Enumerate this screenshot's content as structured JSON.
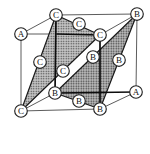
{
  "figure": {
    "kind": "fcc-unit-cell-111-stacking-diagram",
    "background": "#ffffff"
  },
  "diagram": {
    "colors": {
      "thin_edge": "#4a4a4a",
      "bold_edge": "#0d0d0d",
      "plane_stroke": "#1a1a1a",
      "plane_base_c": "#c6c6c6",
      "plane_base_b": "#bfbfbf",
      "plane_dot": "#3f3f3f",
      "atom_fill": "#ffffff",
      "atom_stroke": "#222222",
      "label_color": "#111111"
    },
    "atom_style": {
      "radius": 6.3,
      "stroke_width": 1.15,
      "font_size": 9
    },
    "atoms": [
      {
        "label": "A",
        "x": 21,
        "y": 34,
        "site": "front-top-left-corner"
      },
      {
        "label": "C",
        "x": 56,
        "y": 15,
        "site": "back-top-left-corner"
      },
      {
        "label": "C",
        "x": 79,
        "y": 24,
        "site": "top-face-center"
      },
      {
        "label": "B",
        "x": 137,
        "y": 14,
        "site": "back-top-right-corner"
      },
      {
        "label": "C",
        "x": 100,
        "y": 35,
        "site": "front-top-right-corner"
      },
      {
        "label": "C",
        "x": 40,
        "y": 62,
        "site": "left-face-center"
      },
      {
        "label": "C",
        "x": 63,
        "y": 71,
        "site": "front-face-center"
      },
      {
        "label": "B",
        "x": 93,
        "y": 57,
        "site": "back-face-center"
      },
      {
        "label": "B",
        "x": 119,
        "y": 60,
        "site": "right-face-center"
      },
      {
        "label": "B",
        "x": 55,
        "y": 93,
        "site": "back-bottom-left-corner"
      },
      {
        "label": "B",
        "x": 79,
        "y": 101,
        "site": "bottom-face-center"
      },
      {
        "label": "B",
        "x": 100,
        "y": 109,
        "site": "front-bottom-right-corner"
      },
      {
        "label": "A",
        "x": 136,
        "y": 92,
        "site": "back-bottom-right-corner"
      },
      {
        "label": "C",
        "x": 21,
        "y": 111,
        "site": "front-bottom-left-corner"
      }
    ],
    "edges": [
      {
        "from": [
          21,
          34
        ],
        "to": [
          56,
          15
        ],
        "weight": "thin"
      },
      {
        "from": [
          56,
          15
        ],
        "to": [
          137,
          14
        ],
        "weight": "thin"
      },
      {
        "from": [
          137,
          14
        ],
        "to": [
          136,
          92
        ],
        "weight": "thin"
      },
      {
        "from": [
          21,
          34
        ],
        "to": [
          21,
          111
        ],
        "weight": "thin"
      },
      {
        "from": [
          21,
          111
        ],
        "to": [
          100,
          109
        ],
        "weight": "thin"
      },
      {
        "from": [
          21,
          111
        ],
        "to": [
          55,
          93
        ],
        "weight": "thin"
      },
      {
        "from": [
          100,
          109
        ],
        "to": [
          136,
          92
        ],
        "weight": "thin"
      },
      {
        "from": [
          100,
          35
        ],
        "to": [
          137,
          14
        ],
        "weight": "thin"
      },
      {
        "from": [
          21,
          34
        ],
        "to": [
          57,
          34
        ],
        "weight": "thin"
      },
      {
        "from": [
          57,
          34
        ],
        "to": [
          100,
          35
        ],
        "weight": "bold"
      },
      {
        "from": [
          56,
          15
        ],
        "to": [
          55,
          93
        ],
        "weight": "bold"
      },
      {
        "from": [
          55,
          93
        ],
        "to": [
          136,
          92
        ],
        "weight": "bold"
      },
      {
        "from": [
          100,
          35
        ],
        "to": [
          100,
          109
        ],
        "weight": "bold"
      }
    ],
    "planes": [
      {
        "name": "C-close-packed-plane",
        "pattern": "stipple-c",
        "points": [
          [
            56,
            15
          ],
          [
            100,
            35
          ],
          [
            21,
            111
          ]
        ]
      },
      {
        "name": "B-close-packed-plane",
        "pattern": "stipple-b",
        "points": [
          [
            137,
            14
          ],
          [
            55,
            93
          ],
          [
            100,
            109
          ]
        ]
      }
    ]
  }
}
